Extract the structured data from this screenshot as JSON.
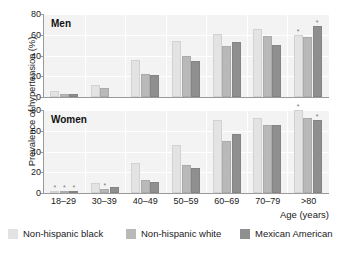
{
  "chart_data": {
    "type": "bar",
    "title": "",
    "ylabel": "Prevalence of hypertension (%)",
    "xlabel": "Age (years)",
    "ylim": [
      0,
      80
    ],
    "yticks": [
      0,
      20,
      40,
      60,
      80
    ],
    "grid": true,
    "legend_position": "bottom",
    "categories": [
      "18–29",
      "30–39",
      "40–49",
      "50–59",
      "60–69",
      "70–79",
      ">80"
    ],
    "legend": [
      "Non-hispanic black",
      "Non-hispanic white",
      "Mexican American"
    ],
    "colors": [
      "#e3e3e3",
      "#b9b9b9",
      "#8f8f8f"
    ],
    "panels": [
      {
        "label": "Men",
        "series": [
          {
            "name": "Non-hispanic black",
            "values": [
              6,
              12,
              36,
              54,
              61,
              66,
              60
            ],
            "flags": [
              "",
              "",
              "",
              "",
              "",
              "",
              "*"
            ]
          },
          {
            "name": "Non-hispanic white",
            "values": [
              3,
              9,
              22,
              40,
              49,
              59,
              58
            ],
            "flags": [
              "",
              "",
              "",
              "",
              "",
              "",
              ""
            ]
          },
          {
            "name": "Mexican American",
            "values": [
              2.5,
              0,
              21,
              35,
              53,
              50,
              68
            ],
            "flags": [
              "",
              "",
              "",
              "",
              "",
              "",
              "*"
            ]
          }
        ]
      },
      {
        "label": "Women",
        "series": [
          {
            "name": "Non-hispanic black",
            "values": [
              1.5,
              10,
              29,
              46,
              70,
              72,
              80
            ],
            "flags": [
              "*",
              "",
              "",
              "",
              "",
              "",
              "*"
            ]
          },
          {
            "name": "Non-hispanic white",
            "values": [
              1.5,
              4,
              13,
              27,
              50,
              66,
              72
            ],
            "flags": [
              "*",
              "*",
              "",
              "",
              "",
              "",
              ""
            ]
          },
          {
            "name": "Mexican American",
            "values": [
              2,
              6,
              11,
              24,
              57,
              66,
              70
            ],
            "flags": [
              "*",
              "",
              "",
              "",
              "",
              "",
              "*"
            ]
          }
        ]
      }
    ]
  }
}
